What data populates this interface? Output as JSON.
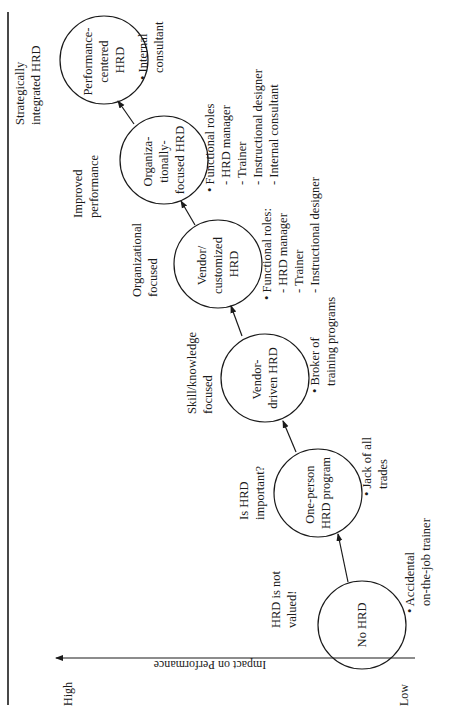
{
  "diagram": {
    "orientation": "rotated-90-ccw",
    "axis": {
      "label": "Impact on Performance",
      "high_label": "High",
      "low_label": "Low"
    },
    "stages": [
      {
        "node_lines": [
          "No HRD"
        ],
        "question_lines": [
          "HRD is not",
          "valued!"
        ],
        "roles_lines": [
          "• Accidental",
          "on-the-job trainer"
        ]
      },
      {
        "node_lines": [
          "One-person",
          "HRD program"
        ],
        "question_lines": [
          "Is HRD",
          "important?"
        ],
        "roles_lines": [
          "• Jack of all",
          "trades"
        ]
      },
      {
        "node_lines": [
          "Vendor-",
          "driven HRD"
        ],
        "question_lines": [
          "Skill/knowledge",
          "focused"
        ],
        "roles_lines": [
          "• Broker of",
          "training programs"
        ]
      },
      {
        "node_lines": [
          "Vendor/",
          "customized",
          "HRD"
        ],
        "question_lines": [
          "Organizational",
          "focused"
        ],
        "roles_lines": [
          "• Functional roles:",
          "- HRD manager",
          "- Trainer",
          "- Instructional designer"
        ]
      },
      {
        "node_lines": [
          "Organiza-",
          "tionally-",
          "focused HRD"
        ],
        "question_lines": [
          "Improved",
          "performance"
        ],
        "roles_lines": [
          "• Functional roles",
          "- HRD manager",
          "- Trainer",
          "- Instructional designer",
          "- Internal consultant"
        ]
      },
      {
        "node_lines": [
          "Performance-",
          "centered",
          "HRD"
        ],
        "question_lines": [
          "Strategically",
          "integrated HRD"
        ],
        "roles_lines": [
          "• Internal",
          "consultant"
        ]
      }
    ],
    "colors": {
      "line": "#1a1a1a",
      "background": "#ffffff"
    }
  }
}
